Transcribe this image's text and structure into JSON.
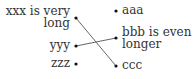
{
  "diagram": {
    "type": "matching",
    "left_items": [
      {
        "id": "xxx",
        "lines": [
          "xxx is very",
          "long"
        ]
      },
      {
        "id": "yyy",
        "lines": [
          "yyy"
        ]
      },
      {
        "id": "zzz",
        "lines": [
          "zzz"
        ]
      }
    ],
    "right_items": [
      {
        "id": "aaa",
        "lines": [
          "aaa"
        ]
      },
      {
        "id": "bbb",
        "lines": [
          "bbb is even",
          "longer"
        ]
      },
      {
        "id": "ccc",
        "lines": [
          "ccc"
        ]
      }
    ],
    "connections": [
      {
        "from": "xxx",
        "to": "ccc"
      },
      {
        "from": "yyy",
        "to": "bbb"
      }
    ],
    "colors": {
      "text": "#333333",
      "line": "#555555",
      "dot": "#111111"
    }
  }
}
